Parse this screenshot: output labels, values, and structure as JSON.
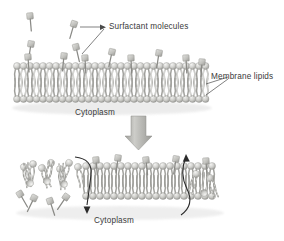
{
  "figure": {
    "title_visible": false,
    "background_color": "#ffffff",
    "palette": {
      "lipid_head_light": "#e8e8e6",
      "lipid_head_mid": "#c9c9c6",
      "lipid_head_dark": "#a6a6a2",
      "lipid_tail": "#b8b8b4",
      "surfactant_head": "#c4c4c0",
      "surfactant_tail": "#8f8f8c",
      "arrow_block": "#b0b0ac",
      "arrow_curve": "#2b2b2b",
      "leader_line": "#4a4a4a",
      "text": "#3a3a3a",
      "shadow": "#d8d8d5"
    }
  },
  "labels": {
    "surfactant_molecules": "Surfactant  molecules",
    "membrane_lipids": "Membrane lipids",
    "cytoplasm_top": "Cytoplasm",
    "cytoplasm_bottom": "Cytoplasm"
  },
  "panels": [
    {
      "id": "panel-top",
      "name": "intact-membrane-with-surfactant",
      "description": "Intact lipid bilayer with surfactant molecules adsorbing onto the outer leaflet",
      "free_surfactants": [
        {
          "x": 30,
          "y": 14,
          "tilt": -6
        },
        {
          "x": 72,
          "y": 22,
          "tilt": 18
        },
        {
          "x": 30,
          "y": 40,
          "tilt": 10
        },
        {
          "x": 72,
          "y": 44,
          "tilt": -14
        }
      ],
      "bound_surfactants": [
        {
          "x": 28,
          "y": 55
        },
        {
          "x": 63,
          "y": 52
        },
        {
          "x": 83,
          "y": 53
        },
        {
          "x": 110,
          "y": 49
        },
        {
          "x": 130,
          "y": 53
        },
        {
          "x": 158,
          "y": 50
        },
        {
          "x": 186,
          "y": 52
        },
        {
          "x": 200,
          "y": 58
        }
      ],
      "bilayer": {
        "x": 14,
        "y": 62,
        "width": 196,
        "height": 42,
        "lipid_count": 30
      }
    },
    {
      "id": "panel-bottom",
      "name": "disrupted-membrane",
      "description": "Surfactant-disrupted bilayer with lipids extracted and membrane permeabilised",
      "bilayer": {
        "x": 22,
        "y": 158,
        "width": 200,
        "height": 52,
        "lipid_count": 28
      },
      "flux_arrows": [
        {
          "name": "inward-flux-arrow",
          "direction": "down",
          "label_ref": "cytoplasm_bottom"
        },
        {
          "name": "outward-flux-arrow",
          "direction": "up",
          "label_ref": null
        }
      ]
    }
  ],
  "connectors": {
    "surfactant_leader_lines": 2,
    "membrane_leader_lines": 2,
    "transition_arrow": {
      "name": "transition-arrow",
      "direction": "down",
      "x": 130,
      "y": 116,
      "width": 18,
      "height": 32
    }
  }
}
